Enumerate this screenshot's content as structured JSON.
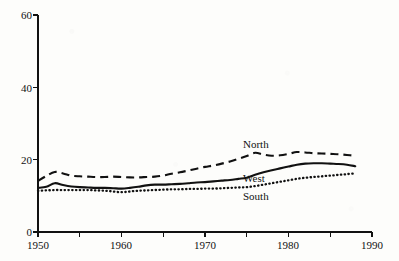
{
  "chart_data": {
    "type": "line",
    "title": "",
    "subtitle": "",
    "xlabel": "",
    "ylabel": "",
    "xlim": [
      1950,
      1990
    ],
    "ylim": [
      0,
      60
    ],
    "grid": false,
    "legend_position": "inline-annotations",
    "y_ticks": [
      0,
      20,
      40,
      60
    ],
    "y_tick_labels": [
      "0",
      "20",
      "40",
      "60"
    ],
    "x_ticks": [
      1950,
      1955,
      1960,
      1965,
      1970,
      1975,
      1980,
      1985,
      1990
    ],
    "x_tick_labels": [
      "1950",
      "",
      "1960",
      "",
      "1970",
      "",
      "1980",
      "",
      "1990"
    ],
    "x_major_labels": [
      "1950",
      "1960",
      "1970",
      "1980",
      "1990"
    ],
    "x": [
      1950,
      1951,
      1952,
      1953,
      1954,
      1955,
      1956,
      1957,
      1958,
      1959,
      1960,
      1961,
      1962,
      1963,
      1964,
      1965,
      1966,
      1967,
      1968,
      1969,
      1970,
      1971,
      1972,
      1973,
      1974,
      1975,
      1976,
      1977,
      1978,
      1979,
      1980,
      1981,
      1982,
      1983,
      1984,
      1985,
      1986,
      1987,
      1988
    ],
    "series": [
      {
        "name": "North",
        "style": "dashed",
        "color": "#111111",
        "label_text": "North",
        "values": [
          14.1,
          15.5,
          16.6,
          16.2,
          15.6,
          15.4,
          15.3,
          15.2,
          15.2,
          15.3,
          15.2,
          15.1,
          15.1,
          15.2,
          15.3,
          15.6,
          16.1,
          16.5,
          17.0,
          17.5,
          18.0,
          18.4,
          18.9,
          19.5,
          20.2,
          21.0,
          21.9,
          21.4,
          21.1,
          21.2,
          21.6,
          22.1,
          22.0,
          21.8,
          21.7,
          21.6,
          21.5,
          21.3,
          21.1
        ]
      },
      {
        "name": "West",
        "style": "solid",
        "color": "#111111",
        "label_text": "West",
        "values": [
          12.2,
          12.5,
          13.5,
          13.0,
          12.6,
          12.4,
          12.3,
          12.2,
          12.2,
          12.1,
          12.0,
          12.2,
          12.5,
          12.9,
          13.1,
          13.1,
          13.2,
          13.3,
          13.5,
          13.7,
          13.8,
          14.0,
          14.2,
          14.4,
          14.7,
          15.0,
          15.8,
          16.5,
          17.1,
          17.6,
          18.1,
          18.6,
          18.9,
          19.0,
          19.0,
          18.9,
          18.8,
          18.6,
          18.2
        ]
      },
      {
        "name": "South",
        "style": "dotted",
        "color": "#111111",
        "label_text": "South",
        "values": [
          11.4,
          11.5,
          11.6,
          11.6,
          11.6,
          11.6,
          11.6,
          11.5,
          11.4,
          11.2,
          11.0,
          11.2,
          11.4,
          11.5,
          11.6,
          11.7,
          11.8,
          11.8,
          11.9,
          11.9,
          12.0,
          12.0,
          12.1,
          12.2,
          12.3,
          12.4,
          12.7,
          13.1,
          13.5,
          13.9,
          14.3,
          14.7,
          15.0,
          15.2,
          15.4,
          15.6,
          15.8,
          16.0,
          16.2
        ]
      }
    ],
    "annotations": [
      {
        "text": "North",
        "series": "North"
      },
      {
        "text": "West",
        "series": "West"
      },
      {
        "text": "South",
        "series": "South"
      }
    ]
  },
  "axes": {
    "y_labels": [
      "60",
      "40",
      "20",
      "0"
    ],
    "x_labels": [
      "1950",
      "1960",
      "1970",
      "1980",
      "1990"
    ]
  },
  "colors": {
    "ink": "#111111",
    "paper": "#fdfdfb"
  }
}
